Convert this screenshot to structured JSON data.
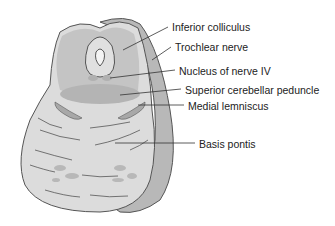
{
  "figure": {
    "labels": [
      {
        "id": "inferior-colliculus",
        "text": "Inferior colliculus",
        "x": 172,
        "y": 22
      },
      {
        "id": "trochlear-nerve",
        "text": "Trochlear nerve",
        "x": 175,
        "y": 42
      },
      {
        "id": "nucleus-nerve-iv",
        "text": "Nucleus of nerve IV",
        "x": 179,
        "y": 66
      },
      {
        "id": "superior-cerebellar-peduncle",
        "text": "Superior cerebellar peduncle",
        "x": 185,
        "y": 85
      },
      {
        "id": "medial-lemniscus",
        "text": "Medial lemniscus",
        "x": 188,
        "y": 101
      },
      {
        "id": "basis-pontis",
        "text": "Basis pontis",
        "x": 199,
        "y": 139
      }
    ],
    "colors": {
      "outline": "#555555",
      "outer_band": "#b8b8b8",
      "tissue_light": "#dcdcdc",
      "tissue_mid": "#c4c4c4",
      "tissue_dark": "#a8a8a8",
      "leader_line": "#333333",
      "label_text": "#222222"
    }
  }
}
